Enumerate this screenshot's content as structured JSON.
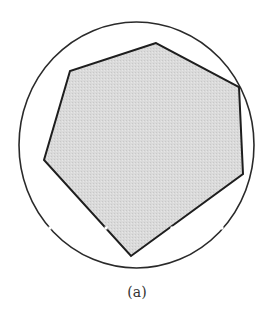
{
  "figure": {
    "caption": "(a)",
    "circle": {
      "cx": 136.5,
      "cy": 145,
      "rx": 117.5,
      "ry": 123,
      "stroke": "#2a2a2a",
      "stroke_width": 1.6
    },
    "polygon": {
      "points": [
        [
          156,
          43
        ],
        [
          70,
          71
        ],
        [
          44,
          160
        ],
        [
          131,
          256
        ],
        [
          243,
          174
        ],
        [
          239,
          87
        ]
      ],
      "fill": "#d9d9d9",
      "stroke": "#1e1e1e",
      "stroke_width": 2
    },
    "gaps": [
      [
        50,
        228
      ],
      [
        106,
        228
      ],
      [
        172,
        228
      ],
      [
        222,
        228
      ]
    ],
    "background": "#ffffff"
  }
}
